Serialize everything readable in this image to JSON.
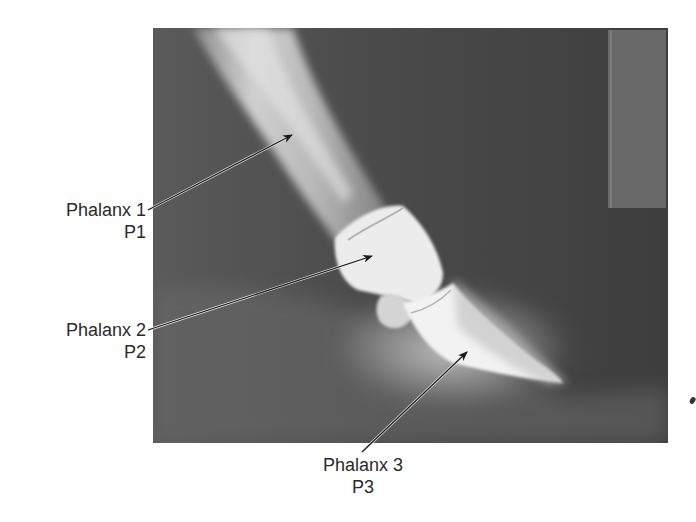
{
  "figure": {
    "image_tone": "grayscale"
  },
  "labels": [
    {
      "id": "p1",
      "name": "Phalanx 1",
      "abbr": "P1"
    },
    {
      "id": "p2",
      "name": "Phalanx 2",
      "abbr": "P2"
    },
    {
      "id": "p3",
      "name": "Phalanx 3",
      "abbr": "P3"
    }
  ],
  "colors": {
    "background": "#ffffff",
    "text": "#2a2a2a",
    "arrow": "#1a1a1a",
    "xray_dark": "#3c3c3c",
    "bone": "#f0f0f0"
  }
}
